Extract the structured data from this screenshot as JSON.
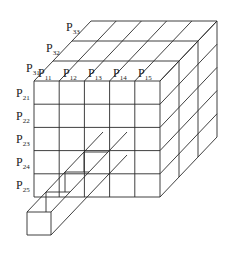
{
  "diagram": {
    "colors": {
      "line": "#2a2a2a",
      "text": "#1a1a1a",
      "background": "#ffffff"
    },
    "geometry": {
      "origin": [
        34,
        81
      ],
      "cell_w": 25.2,
      "cell_h": 23.2,
      "cols": 5,
      "rows": 5,
      "depth_vec": [
        19,
        -20
      ],
      "layers": 3
    },
    "top_labels": [
      {
        "base": "P",
        "sub": "11",
        "x": 38,
        "y": 77
      },
      {
        "base": "P",
        "sub": "12",
        "x": 63,
        "y": 77
      },
      {
        "base": "P",
        "sub": "13",
        "x": 88,
        "y": 77
      },
      {
        "base": "P",
        "sub": "14",
        "x": 113,
        "y": 77
      },
      {
        "base": "P",
        "sub": "15",
        "x": 138,
        "y": 77
      }
    ],
    "left_labels": [
      {
        "base": "P",
        "sub": "21",
        "x": 16,
        "y": 97
      },
      {
        "base": "P",
        "sub": "22",
        "x": 16,
        "y": 120
      },
      {
        "base": "P",
        "sub": "23",
        "x": 16,
        "y": 143
      },
      {
        "base": "P",
        "sub": "24",
        "x": 16,
        "y": 166
      },
      {
        "base": "P",
        "sub": "25",
        "x": 16,
        "y": 189
      }
    ],
    "depth_labels": [
      {
        "base": "P",
        "sub": "31",
        "x": 26,
        "y": 72
      },
      {
        "base": "P",
        "sub": "32",
        "x": 46,
        "y": 52
      },
      {
        "base": "P",
        "sub": "33",
        "x": 66,
        "y": 31
      }
    ],
    "extracted_bar": {
      "front_box": [
        27,
        212,
        24,
        23
      ],
      "depth_steps": 4
    },
    "caption": ""
  }
}
